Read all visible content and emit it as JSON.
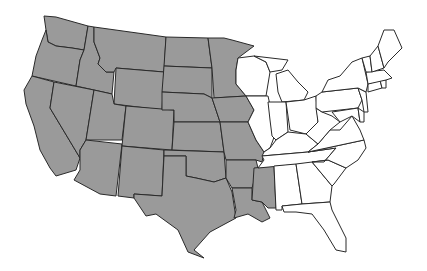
{
  "map": {
    "title": "United States (contiguous) — western region shaded",
    "colors": {
      "shaded": "#9a9a9a",
      "unshaded": "#ffffff",
      "border": "#2a2a2a"
    },
    "shaded_states": [
      "WA",
      "OR",
      "CA",
      "ID",
      "NV",
      "MT",
      "WY",
      "UT",
      "AZ",
      "CO",
      "NM",
      "ND",
      "SD",
      "NE",
      "KS",
      "OK",
      "TX",
      "MN",
      "IA",
      "MO",
      "AR",
      "LA",
      "MS"
    ],
    "unshaded_states": [
      "WI",
      "IL",
      "MI",
      "IN",
      "OH",
      "KY",
      "TN",
      "AL",
      "GA",
      "FL",
      "SC",
      "NC",
      "VA",
      "WV",
      "PA",
      "NY",
      "MD",
      "DE",
      "NJ",
      "CT",
      "RI",
      "MA",
      "VT",
      "NH",
      "ME"
    ]
  }
}
